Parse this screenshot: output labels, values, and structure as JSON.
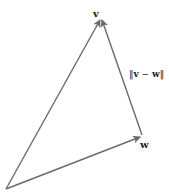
{
  "diagram": {
    "type": "vector-triangle",
    "stroke_color": "#6b6b6b",
    "origin": {
      "x": 6,
      "y": 189
    },
    "vectors": [
      {
        "name": "v",
        "tip": {
          "x": 101,
          "y": 18
        }
      },
      {
        "name": "w",
        "tip": {
          "x": 142,
          "y": 136
        }
      },
      {
        "name": "v - w",
        "from": {
          "x": 142,
          "y": 136
        },
        "to": {
          "x": 101,
          "y": 18
        }
      }
    ],
    "labels": {
      "v": "v",
      "w": "w",
      "norm_bar_left": "‖",
      "norm_v": "v",
      "norm_minus": "−",
      "norm_w": "w",
      "norm_bar_right": "‖"
    }
  }
}
